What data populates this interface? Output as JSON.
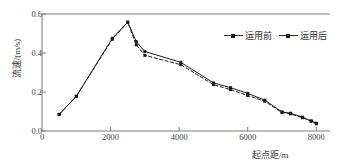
{
  "chart_data": {
    "type": "line",
    "title": "",
    "xlabel": "起点距/m",
    "ylabel": "流速/(m/s)",
    "xlim": [
      0,
      8400
    ],
    "ylim": [
      0.0,
      0.6
    ],
    "xticks": [
      0,
      2000,
      4000,
      6000,
      8000
    ],
    "xtick_labels": [
      "0",
      "2000",
      "4000",
      "6000",
      "8000"
    ],
    "yticks": [
      0.0,
      0.2,
      0.4,
      0.6
    ],
    "ytick_labels": [
      "0.0",
      "0.2",
      "0.4",
      "0.6"
    ],
    "grid": false,
    "legend_position": "top-right",
    "series": [
      {
        "name": "运用前",
        "marker": "square",
        "line_style": "solid",
        "color": "#1b1b1b",
        "x": [
          500,
          1000,
          2050,
          2500,
          2750,
          3000,
          4050,
          5000,
          5500,
          6000,
          6500,
          7000,
          7250,
          7600,
          7850,
          8000
        ],
        "values": [
          0.085,
          0.178,
          0.475,
          0.558,
          0.458,
          0.408,
          0.352,
          0.247,
          0.222,
          0.193,
          0.158,
          0.098,
          0.091,
          0.071,
          0.052,
          0.04
        ]
      },
      {
        "name": "运用后",
        "marker": "square",
        "line_style": "dashed",
        "color": "#1b1b1b",
        "x": [
          500,
          1000,
          2050,
          2500,
          2750,
          3000,
          4050,
          5000,
          5500,
          6000,
          6500,
          7000,
          7250,
          7600,
          7850,
          8000
        ],
        "values": [
          0.085,
          0.178,
          0.47,
          0.558,
          0.442,
          0.388,
          0.34,
          0.238,
          0.212,
          0.182,
          0.152,
          0.095,
          0.088,
          0.068,
          0.05,
          0.037
        ]
      }
    ]
  },
  "legend": {
    "items": [
      {
        "label": "运用前"
      },
      {
        "label": "运用后"
      }
    ]
  }
}
